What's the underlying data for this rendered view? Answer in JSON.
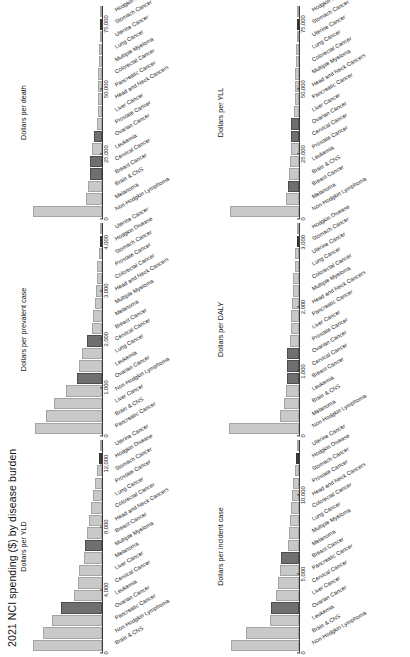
{
  "figure": {
    "title": "2021 NCI spending ($) by disease burden"
  },
  "chart_data": [
    {
      "type": "bar",
      "title": "Dollars per incident case",
      "xlabel": "",
      "ylabel": "",
      "orientation": "vertical",
      "axis_ticks": [
        "0",
        "5,000",
        "10,000"
      ],
      "xlim": [
        0,
        13500
      ],
      "categories": [
        "Non-Hodgkin Lymphoma",
        "Brain & CNS",
        "Leukemia",
        "Ovarian Cancer",
        "Liver Cancer",
        "Cervical Cancer",
        "Pancreatic Cancer",
        "Breast Cancer",
        "Melanoma",
        "Multiple Myeloma",
        "Lung Cancer",
        "Colorectal Cancer",
        "Head and Neck Cancers",
        "Prostate Cancer",
        "Stomach Cancer",
        "Hodgkin Disease",
        "Uterine Cancer"
      ],
      "values": [
        12600,
        9800,
        5400,
        5100,
        4300,
        3800,
        3500,
        3300,
        2000,
        1900,
        1700,
        1400,
        1300,
        1100,
        700,
        500,
        300
      ],
      "shades": [
        "light",
        "light",
        "light",
        "dark",
        "light",
        "light",
        "light",
        "dark",
        "light",
        "light",
        "light",
        "light",
        "light",
        "light",
        "light",
        "vdark",
        "light"
      ]
    },
    {
      "type": "bar",
      "title": "Dollars per prevalent case",
      "xlabel": "",
      "ylabel": "",
      "orientation": "vertical",
      "axis_ticks": [
        "0",
        "1,000",
        "2,000",
        "3,000",
        "4,000"
      ],
      "xlim": [
        0,
        4400
      ],
      "categories": [
        "Pancreatic Cancer",
        "Brain & CNS",
        "Liver Cancer",
        "Non-Hodgkin Lymphoma",
        "Ovarian Cancer",
        "Leukemia",
        "Lung Cancer",
        "Cervical Cancer",
        "Breast Cancer",
        "Melanoma",
        "Multiple Myeloma",
        "Head and Neck Cancers",
        "Colorectal Cancer",
        "Prostate Cancer",
        "Stomach Cancer",
        "Hodgkin Disease",
        "Uterine Cancer"
      ],
      "values": [
        4050,
        3400,
        2900,
        2200,
        1500,
        1400,
        1200,
        900,
        620,
        520,
        430,
        380,
        330,
        280,
        200,
        140,
        90
      ],
      "shades": [
        "light",
        "light",
        "light",
        "light",
        "dark",
        "light",
        "light",
        "dark",
        "light",
        "light",
        "light",
        "light",
        "light",
        "light",
        "light",
        "vdark",
        "light"
      ]
    },
    {
      "type": "bar",
      "title": "Dollars per death",
      "xlabel": "",
      "ylabel": "",
      "orientation": "vertical",
      "axis_ticks": [
        "0",
        "25,000",
        "50,000",
        "75,000"
      ],
      "xlim": [
        0,
        82000
      ],
      "categories": [
        "Non-Hodgkin Lymphoma",
        "Melanoma",
        "Brain & CNS",
        "Breast Cancer",
        "Cervical Cancer",
        "Leukemia",
        "Ovarian Cancer",
        "Prostate Cancer",
        "Liver Cancer",
        "Head and Neck Cancers",
        "Pancreatic Cancer",
        "Colorectal Cancer",
        "Multiple Myeloma",
        "Lung Cancer",
        "Uterine Cancer",
        "Stomach Cancer",
        "Hodgkin Disease"
      ],
      "values": [
        78000,
        17500,
        15500,
        13000,
        13000,
        11500,
        9000,
        5500,
        5000,
        4500,
        4200,
        4000,
        3600,
        3200,
        2800,
        1800,
        600
      ],
      "shades": [
        "light",
        "light",
        "light",
        "dark",
        "dark",
        "light",
        "dark",
        "light",
        "light",
        "light",
        "light",
        "light",
        "light",
        "light",
        "light",
        "vdark",
        "light"
      ]
    },
    {
      "type": "bar",
      "title": "Dollars per DALY",
      "xlabel": "",
      "ylabel": "",
      "orientation": "vertical",
      "axis_ticks": [
        "0",
        "1,000",
        "2,000",
        "3,000"
      ],
      "xlim": [
        0,
        3300
      ],
      "categories": [
        "Non-Hodgkin Lymphoma",
        "Melanoma",
        "Brain & CNS",
        "Leukemia",
        "Breast Cancer",
        "Cervical Cancer",
        "Ovarian Cancer",
        "Prostate Cancer",
        "Liver Cancer",
        "Pancreatic Cancer",
        "Head and Neck Cancers",
        "Multiple Myeloma",
        "Colorectal Cancer",
        "Lung Cancer",
        "Uterine Cancer",
        "Stomach Cancer",
        "Hodgkin Disease"
      ],
      "values": [
        3150,
        850,
        680,
        600,
        560,
        540,
        530,
        400,
        370,
        350,
        320,
        290,
        250,
        200,
        160,
        100,
        40
      ],
      "shades": [
        "light",
        "light",
        "light",
        "light",
        "dark",
        "dark",
        "dark",
        "light",
        "light",
        "light",
        "light",
        "light",
        "light",
        "light",
        "light",
        "vdark",
        "light"
      ]
    },
    {
      "type": "bar",
      "title": "Dollars per YLD",
      "xlabel": "",
      "ylabel": "",
      "orientation": "vertical",
      "axis_ticks": [
        "0",
        "4,000",
        "8,000",
        "12,000"
      ],
      "xlim": [
        0,
        13500
      ],
      "categories": [
        "Brain & CNS",
        "Non-Hodgkin Lymphoma",
        "Pancreatic Cancer",
        "Ovarian Cancer",
        "Leukemia",
        "Cervical Cancer",
        "Liver Cancer",
        "Melanoma",
        "Multiple Myeloma",
        "Breast Cancer",
        "Head and Neck Cancers",
        "Colorectal Cancer",
        "Lung Cancer",
        "Prostate Cancer",
        "Stomach Cancer",
        "Hodgkin Disease",
        "Uterine Cancer"
      ],
      "values": [
        12800,
        10900,
        9200,
        7600,
        5200,
        4500,
        4300,
        3400,
        3100,
        2700,
        2400,
        2000,
        1700,
        1300,
        900,
        500,
        250
      ],
      "shades": [
        "light",
        "light",
        "light",
        "dark",
        "light",
        "light",
        "light",
        "light",
        "dark",
        "light",
        "light",
        "light",
        "light",
        "light",
        "light",
        "vdark",
        "light"
      ]
    },
    {
      "type": "bar",
      "title": "Dollars per YLL",
      "xlabel": "",
      "ylabel": "",
      "orientation": "vertical",
      "axis_ticks": [
        "0",
        "25,000",
        "50,000",
        "75,000"
      ],
      "xlim": [
        0,
        82000
      ],
      "categories": [
        "Non-Hodgkin Lymphoma",
        "Melanoma",
        "Breast Cancer",
        "Brain & CNS",
        "Leukemia",
        "Prostate Cancer",
        "Cervical Cancer",
        "Ovarian Cancer",
        "Liver Cancer",
        "Pancreatic Cancer",
        "Head and Neck Cancers",
        "Multiple Myeloma",
        "Colorectal Cancer",
        "Lung Cancer",
        "Uterine Cancer",
        "Stomach Cancer",
        "Hodgkin Disease"
      ],
      "values": [
        78000,
        14500,
        12000,
        11000,
        10500,
        9500,
        9000,
        8500,
        5500,
        5000,
        4500,
        4200,
        3800,
        3200,
        2600,
        1500,
        500
      ],
      "shades": [
        "light",
        "light",
        "dark",
        "light",
        "light",
        "light",
        "dark",
        "dark",
        "light",
        "light",
        "light",
        "light",
        "light",
        "light",
        "light",
        "vdark",
        "light"
      ]
    }
  ]
}
